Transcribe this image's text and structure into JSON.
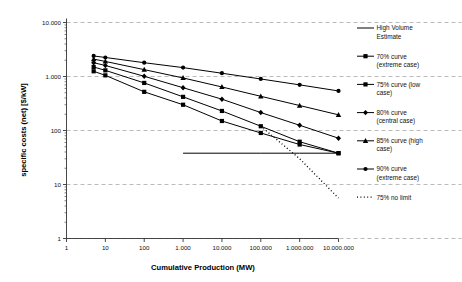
{
  "chart_data": {
    "type": "line",
    "title": "",
    "xlabel": "Cumulative Production (MW)",
    "ylabel": "specific costs (net) [$/kW]",
    "xscale": "log",
    "yscale": "log",
    "xlim": [
      1,
      10000000
    ],
    "ylim": [
      1,
      10000
    ],
    "grid": "horizontal-dashed",
    "legend_position": "right",
    "xticks": [
      "1",
      "10",
      "100",
      "1.000",
      "10.000",
      "100.000",
      "1.000.000",
      "10.000.000"
    ],
    "xtick_values": [
      1,
      10,
      100,
      1000,
      10000,
      100000,
      1000000,
      10000000
    ],
    "yticks": [
      "1",
      "10",
      "100",
      "1.000",
      "10.000"
    ],
    "ytick_values": [
      1,
      10,
      100,
      1000,
      10000
    ],
    "series": [
      {
        "name": "High Volume Estimate",
        "marker": "none",
        "style": "solid",
        "x": [
          1000,
          10000,
          100000,
          1000000,
          10000000
        ],
        "y": [
          38,
          38,
          38,
          38,
          38
        ]
      },
      {
        "name": "70% curve (extreme case)",
        "marker": "square",
        "style": "solid",
        "x": [
          5,
          10,
          100,
          1000,
          10000,
          100000,
          1000000,
          10000000
        ],
        "y": [
          1250,
          1050,
          520,
          300,
          150,
          90,
          55,
          38
        ]
      },
      {
        "name": "75% curve (low case)",
        "marker": "square",
        "style": "solid",
        "x": [
          5,
          10,
          100,
          1000,
          10000,
          100000,
          1000000,
          10000000
        ],
        "y": [
          1500,
          1300,
          760,
          420,
          230,
          120,
          62,
          38
        ]
      },
      {
        "name": "80% curve (central case)",
        "marker": "diamond",
        "style": "solid",
        "x": [
          5,
          10,
          100,
          1000,
          10000,
          100000,
          1000000,
          10000000
        ],
        "y": [
          1800,
          1600,
          1010,
          620,
          380,
          215,
          125,
          72
        ]
      },
      {
        "name": "85% curve (high case)",
        "marker": "triangle",
        "style": "solid",
        "x": [
          5,
          10,
          100,
          1000,
          10000,
          100000,
          1000000,
          10000000
        ],
        "y": [
          2100,
          1900,
          1340,
          940,
          640,
          430,
          290,
          195
        ]
      },
      {
        "name": "90% curve (extreme case)",
        "marker": "dot",
        "style": "solid",
        "x": [
          5,
          10,
          100,
          1000,
          10000,
          100000,
          1000000,
          10000000
        ],
        "y": [
          2400,
          2250,
          1800,
          1460,
          1150,
          900,
          700,
          540
        ]
      },
      {
        "name": "75% no limit",
        "marker": "none",
        "style": "dotted",
        "x": [
          100000,
          1000000,
          10000000
        ],
        "y": [
          120,
          30,
          5.6
        ]
      }
    ]
  },
  "axes": {
    "x_title": "Cumulative Production (MW)",
    "y_title": "specific costs (net) [$/kW]"
  },
  "legend": {
    "items": [
      {
        "label_line1": "High Volume",
        "label_line2": "Estimate",
        "marker": "none",
        "style": "solid"
      },
      {
        "label_line1": "70% curve",
        "label_line2": "(extreme case)",
        "marker": "square",
        "style": "solid"
      },
      {
        "label_line1": "75% curve (low",
        "label_line2": "case)",
        "marker": "square",
        "style": "solid"
      },
      {
        "label_line1": "80% curve",
        "label_line2": "(central case)",
        "marker": "diamond",
        "style": "solid"
      },
      {
        "label_line1": "85% curve (high",
        "label_line2": "case)",
        "marker": "triangle",
        "style": "solid"
      },
      {
        "label_line1": "90% curve",
        "label_line2": "(extreme case)",
        "marker": "dot",
        "style": "solid"
      },
      {
        "label_line1": "75% no limit",
        "label_line2": "",
        "marker": "none",
        "style": "dotted"
      }
    ]
  },
  "colors": {
    "line": "#000000",
    "grid": "#aaaaaa",
    "axis": "#333333",
    "background": "#ffffff"
  }
}
